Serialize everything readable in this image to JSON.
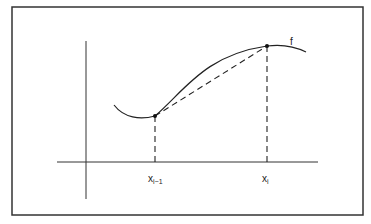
{
  "diagram": {
    "curve_label": "f",
    "points": [
      {
        "id": "left",
        "label_main": "x",
        "label_sub": "i−1"
      },
      {
        "id": "right",
        "label_main": "x",
        "label_sub": "i"
      }
    ],
    "colors": {
      "stroke": "#222222",
      "frame": "#333333",
      "background": "#ffffff"
    }
  }
}
